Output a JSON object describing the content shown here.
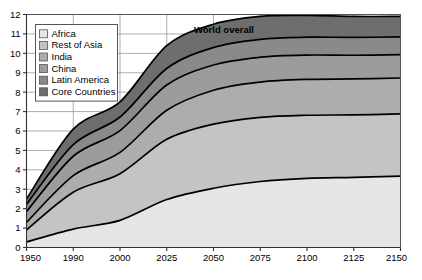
{
  "chart_data": {
    "type": "area",
    "stacked": true,
    "title": "",
    "xlabel": "",
    "ylabel": "",
    "annotation": "World overall",
    "grid": true,
    "legend_position": "top-left",
    "ylim": [
      0,
      12
    ],
    "yticks": [
      0,
      1,
      2,
      3,
      4,
      5,
      6,
      7,
      8,
      9,
      10,
      11,
      12
    ],
    "ytick_labels": [
      "0",
      "1",
      "2",
      "3",
      "4",
      "5",
      "6",
      "7",
      "8",
      "9",
      "10",
      "11",
      "12"
    ],
    "categories": [
      "1950",
      "1990",
      "2000",
      "2025",
      "2050",
      "2075",
      "2100",
      "2125",
      "2150"
    ],
    "x": [
      1950,
      1990,
      2000,
      2025,
      2050,
      2075,
      2100,
      2125,
      2150
    ],
    "series": [
      {
        "name": "Core Countries",
        "color": "#6e6e6e",
        "values": [
          0.28,
          0.8,
          0.78,
          1.18,
          1.2,
          1.18,
          1.12,
          1.08,
          1.05
        ]
      },
      {
        "name": "Latin America",
        "color": "#8a8a8a",
        "values": [
          0.38,
          0.6,
          0.7,
          0.85,
          0.9,
          0.92,
          0.92,
          0.92,
          0.92
        ]
      },
      {
        "name": "China",
        "color": "#9c9c9c",
        "values": [
          0.55,
          1.0,
          1.12,
          1.3,
          1.3,
          1.28,
          1.25,
          1.22,
          1.2
        ]
      },
      {
        "name": "India",
        "color": "#adadad",
        "values": [
          0.38,
          0.85,
          1.1,
          1.5,
          1.75,
          1.82,
          1.85,
          1.85,
          1.85
        ]
      },
      {
        "name": "Rest of Asia",
        "color": "#c4c4c4",
        "values": [
          0.62,
          1.9,
          2.4,
          3.1,
          3.3,
          3.3,
          3.25,
          3.22,
          3.2
        ]
      },
      {
        "name": "Africa",
        "color": "#e6e6e6",
        "values": [
          0.29,
          0.95,
          1.4,
          2.47,
          3.05,
          3.4,
          3.56,
          3.61,
          3.68
        ]
      }
    ],
    "totals": [
      2.5,
      6.1,
      7.5,
      10.4,
      11.5,
      11.9,
      11.95,
      11.9,
      11.9
    ],
    "legend_entries": [
      {
        "label": "Africa",
        "color": "#e6e6e6"
      },
      {
        "label": "Rest of Asia",
        "color": "#c4c4c4"
      },
      {
        "label": "India",
        "color": "#adadad"
      },
      {
        "label": "China",
        "color": "#9c9c9c"
      },
      {
        "label": "Latin America",
        "color": "#8a8a8a"
      },
      {
        "label": "Core Countries",
        "color": "#6e6e6e"
      }
    ]
  }
}
